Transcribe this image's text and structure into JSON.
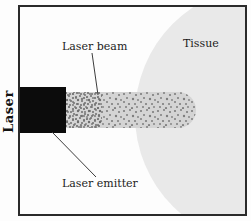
{
  "diagram": {
    "labels": {
      "laser_beam": "Laser beam",
      "tissue": "Tissue",
      "laser_emitter": "Laser emitter",
      "laser_axis": "Laser"
    },
    "colors": {
      "tissue_fill": "#e9e9e9",
      "beam_fill": "#d4d4d4",
      "beam_dots": "#7d7d7d",
      "emitter_fill": "#0c0c0c",
      "frame_border": "#2b2b2b",
      "pointer_line": "#3c3c3c",
      "text": "#1c1c1c",
      "background": "#fdfdfd"
    }
  }
}
